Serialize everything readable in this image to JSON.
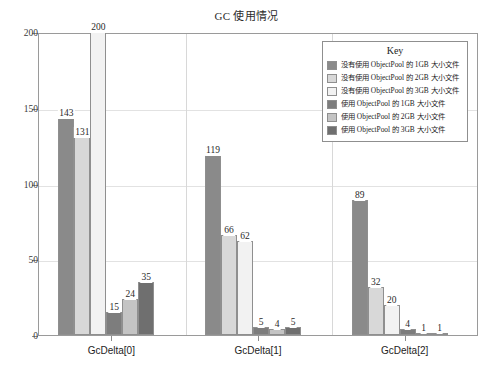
{
  "chart_data": {
    "type": "bar",
    "title": "GC 使用情况",
    "xlabel": "",
    "ylabel": "",
    "ylim": [
      0,
      200
    ],
    "yticks": [
      0,
      50,
      100,
      150,
      200
    ],
    "grid": true,
    "legend_position": "top-right",
    "legend_title": "Key",
    "categories": [
      "GcDelta[0]",
      "GcDelta[1]",
      "GcDelta[2]"
    ],
    "series": [
      {
        "name": "没有使用 ObjectPool 的 1GB 大小文件",
        "color": "#8a8a8a",
        "values": [
          143,
          119,
          89
        ]
      },
      {
        "name": "没有使用 ObjectPool 的 2GB 大小文件",
        "color": "#d8d8d8",
        "values": [
          131,
          66,
          32
        ]
      },
      {
        "name": "没有使用 ObjectPool 的 3GB 大小文件",
        "color": "#f2f2f2",
        "values": [
          200,
          62,
          20
        ]
      },
      {
        "name": "使用 ObjectPool 的 1GB 大小文件",
        "color": "#7d7d7d",
        "values": [
          15,
          5,
          4
        ]
      },
      {
        "name": "使用 ObjectPool 的 2GB 大小文件",
        "color": "#c4c4c4",
        "values": [
          24,
          4,
          1
        ]
      },
      {
        "name": "使用 ObjectPool 的 3GB 大小文件",
        "color": "#6f6f6f",
        "values": [
          35,
          5,
          1
        ]
      }
    ]
  },
  "axis": {
    "y_tick_labels": [
      "200",
      "150",
      "100",
      "50",
      "0"
    ]
  }
}
